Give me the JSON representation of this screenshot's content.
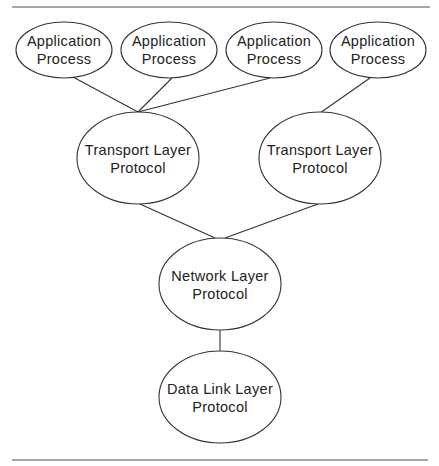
{
  "diagram": {
    "nodes": [
      {
        "id": "app1",
        "lines": [
          "Application",
          "Process"
        ],
        "cx": 64,
        "cy": 50,
        "rx": 48,
        "ry": 28
      },
      {
        "id": "app2",
        "lines": [
          "Application",
          "Process"
        ],
        "cx": 169,
        "cy": 50,
        "rx": 48,
        "ry": 28
      },
      {
        "id": "app3",
        "lines": [
          "Application",
          "Process"
        ],
        "cx": 274,
        "cy": 50,
        "rx": 48,
        "ry": 28
      },
      {
        "id": "app4",
        "lines": [
          "Application",
          "Process"
        ],
        "cx": 378,
        "cy": 50,
        "rx": 48,
        "ry": 28
      },
      {
        "id": "transport1",
        "lines": [
          "Transport Layer",
          "Protocol"
        ],
        "cx": 138,
        "cy": 158,
        "rx": 61,
        "ry": 46
      },
      {
        "id": "transport2",
        "lines": [
          "Transport Layer",
          "Protocol"
        ],
        "cx": 320,
        "cy": 158,
        "rx": 61,
        "ry": 46
      },
      {
        "id": "network",
        "lines": [
          "Network Layer",
          "Protocol"
        ],
        "cx": 220,
        "cy": 284,
        "rx": 61,
        "ry": 46
      },
      {
        "id": "datalink",
        "lines": [
          "Data Link Layer",
          "Protocol"
        ],
        "cx": 220,
        "cy": 397,
        "rx": 61,
        "ry": 46
      }
    ],
    "edges": [
      {
        "from": "app1",
        "to": "transport1"
      },
      {
        "from": "app2",
        "to": "transport1"
      },
      {
        "from": "app3",
        "to": "transport1"
      },
      {
        "from": "app4",
        "to": "transport2"
      },
      {
        "from": "transport1",
        "to": "network"
      },
      {
        "from": "transport2",
        "to": "network"
      },
      {
        "from": "network",
        "to": "datalink"
      }
    ]
  }
}
